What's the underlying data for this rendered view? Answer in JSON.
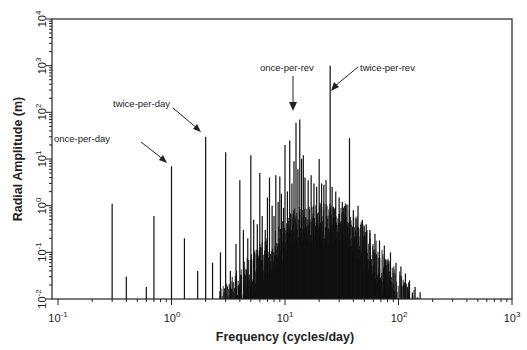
{
  "chart_data": {
    "type": "bar",
    "subtype": "spectral-lines-log-log",
    "title": "",
    "xlabel": "Frequency (cycles/day)",
    "ylabel": "Radial Amplitude (m)",
    "xscale": "log",
    "yscale": "log",
    "xlim": [
      0.1,
      1000
    ],
    "ylim": [
      0.01,
      10000
    ],
    "grid": false,
    "legend": null,
    "x_ticks": [
      "10^-1",
      "10^0",
      "10^1",
      "10^2",
      "10^3"
    ],
    "y_ticks": [
      "10^-2",
      "10^-1",
      "10^0",
      "10^1",
      "10^2",
      "10^3",
      "10^4"
    ],
    "x_tick_values": [
      0.1,
      1,
      10,
      100,
      1000
    ],
    "y_tick_values": [
      0.01,
      0.1,
      1,
      10,
      100,
      1000,
      10000
    ],
    "annotations": [
      {
        "text": "once-per-day",
        "x": 1.0,
        "y": 7
      },
      {
        "text": "twice-per-day",
        "x": 2.0,
        "y": 30
      },
      {
        "text": "once-per-rev",
        "x": 12.5,
        "y": 60
      },
      {
        "text": "twice-per-rev",
        "x": 25,
        "y": 1000
      }
    ],
    "lines": [
      {
        "f": 0.3,
        "a": 1.1
      },
      {
        "f": 0.4,
        "a": 0.03
      },
      {
        "f": 0.6,
        "a": 0.018
      },
      {
        "f": 0.7,
        "a": 0.6
      },
      {
        "f": 1.0,
        "a": 7
      },
      {
        "f": 1.3,
        "a": 0.2
      },
      {
        "f": 1.7,
        "a": 0.04
      },
      {
        "f": 2.0,
        "a": 30
      },
      {
        "f": 2.3,
        "a": 0.06
      },
      {
        "f": 2.7,
        "a": 0.1
      },
      {
        "f": 3.0,
        "a": 14
      },
      {
        "f": 3.3,
        "a": 0.04
      },
      {
        "f": 3.7,
        "a": 0.15
      },
      {
        "f": 4.0,
        "a": 3.5
      },
      {
        "f": 4.3,
        "a": 0.3
      },
      {
        "f": 4.7,
        "a": 0.2
      },
      {
        "f": 5.0,
        "a": 12
      },
      {
        "f": 5.3,
        "a": 0.5
      },
      {
        "f": 5.7,
        "a": 0.4
      },
      {
        "f": 6.0,
        "a": 5
      },
      {
        "f": 6.3,
        "a": 0.6
      },
      {
        "f": 6.7,
        "a": 0.3
      },
      {
        "f": 7.0,
        "a": 1.5
      },
      {
        "f": 7.3,
        "a": 4
      },
      {
        "f": 7.7,
        "a": 1.0
      },
      {
        "f": 8.0,
        "a": 0.6
      },
      {
        "f": 8.3,
        "a": 4.5
      },
      {
        "f": 8.7,
        "a": 1.2
      },
      {
        "f": 9.0,
        "a": 4.2
      },
      {
        "f": 9.3,
        "a": 1.8
      },
      {
        "f": 9.7,
        "a": 0.9
      },
      {
        "f": 10.0,
        "a": 20
      },
      {
        "f": 10.5,
        "a": 2.0
      },
      {
        "f": 11.0,
        "a": 25
      },
      {
        "f": 11.5,
        "a": 3.0
      },
      {
        "f": 12.0,
        "a": 9
      },
      {
        "f": 12.5,
        "a": 60
      },
      {
        "f": 13.0,
        "a": 6
      },
      {
        "f": 13.5,
        "a": 70
      },
      {
        "f": 14.0,
        "a": 10
      },
      {
        "f": 14.5,
        "a": 12
      },
      {
        "f": 15.0,
        "a": 4
      },
      {
        "f": 16.0,
        "a": 3.5
      },
      {
        "f": 17.0,
        "a": 4.5
      },
      {
        "f": 18.0,
        "a": 3
      },
      {
        "f": 19.0,
        "a": 2.5
      },
      {
        "f": 20.0,
        "a": 10
      },
      {
        "f": 21.0,
        "a": 3
      },
      {
        "f": 22.0,
        "a": 2.8
      },
      {
        "f": 23.0,
        "a": 3.5
      },
      {
        "f": 25.0,
        "a": 1000
      },
      {
        "f": 26.0,
        "a": 2.5
      },
      {
        "f": 28.0,
        "a": 2.0
      },
      {
        "f": 30.0,
        "a": 1.5
      },
      {
        "f": 32.0,
        "a": 1.2
      },
      {
        "f": 34.0,
        "a": 1.0
      },
      {
        "f": 37.0,
        "a": 28
      },
      {
        "f": 40.0,
        "a": 0.8
      },
      {
        "f": 44.0,
        "a": 1.0
      },
      {
        "f": 48.0,
        "a": 0.5
      },
      {
        "f": 52.0,
        "a": 0.4
      },
      {
        "f": 56.0,
        "a": 0.3
      },
      {
        "f": 62.0,
        "a": 0.25
      },
      {
        "f": 68.0,
        "a": 0.18
      },
      {
        "f": 75.0,
        "a": 0.14
      },
      {
        "f": 85.0,
        "a": 0.1
      },
      {
        "f": 95.0,
        "a": 0.06
      },
      {
        "f": 105.0,
        "a": 0.05
      },
      {
        "f": 115.0,
        "a": 0.035
      },
      {
        "f": 125.0,
        "a": 0.025
      },
      {
        "f": 140.0,
        "a": 0.018
      },
      {
        "f": 155.0,
        "a": 0.014
      }
    ],
    "envelope_note": "Dense black band of many small lines between ~2.5 and ~160 cycles/day, rising to ~1 m near 10-30 c/d and decaying to 0.01 m by ~160 c/d"
  },
  "figure": {
    "xlabel": "Frequency (cycles/day)",
    "ylabel": "Radial Amplitude (m)",
    "x_ticks": [
      {
        "base": "10",
        "exp": "-1"
      },
      {
        "base": "10",
        "exp": "0"
      },
      {
        "base": "10",
        "exp": "1"
      },
      {
        "base": "10",
        "exp": "2"
      },
      {
        "base": "10",
        "exp": "3"
      }
    ],
    "y_ticks": [
      {
        "base": "10",
        "exp": "-2"
      },
      {
        "base": "10",
        "exp": "-1"
      },
      {
        "base": "10",
        "exp": "0"
      },
      {
        "base": "10",
        "exp": "1"
      },
      {
        "base": "10",
        "exp": "2"
      },
      {
        "base": "10",
        "exp": "3"
      },
      {
        "base": "10",
        "exp": "4"
      }
    ],
    "annotations": {
      "once_per_day": "once-per-day",
      "twice_per_day": "twice-per-day",
      "once_per_rev": "once-per-rev",
      "twice_per_rev": "twice-per-rev"
    },
    "colors": {
      "ink": "#111111",
      "background": "#ffffff"
    }
  }
}
